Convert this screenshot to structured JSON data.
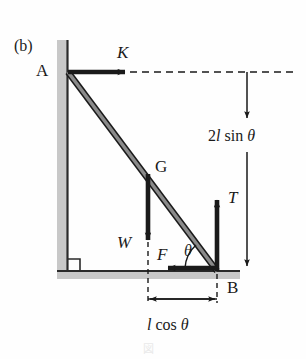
{
  "figure": {
    "panel_label": "(b)",
    "background_color": "#fefefe",
    "stroke_color": "#1a1a1a",
    "wall_color": "#c8c8c8",
    "rod_color": "#6e6e6e",
    "width": 306,
    "height": 359
  },
  "points": {
    "A": {
      "label": "A",
      "x": 68,
      "y": 72
    },
    "B": {
      "label": "B",
      "x": 217,
      "y": 271
    },
    "G": {
      "label": "G",
      "x": 148,
      "y": 172
    }
  },
  "forces": [
    {
      "name": "K",
      "label": "K",
      "direction": "right",
      "applied_at": "A"
    },
    {
      "name": "W",
      "label": "W",
      "direction": "down",
      "applied_at": "G"
    },
    {
      "name": "T",
      "label": "T",
      "direction": "up",
      "applied_at": "B"
    },
    {
      "name": "F",
      "label": "F",
      "direction": "left",
      "applied_at": "B"
    }
  ],
  "angle": {
    "label": "θ",
    "at": "B",
    "between": "rod and ground"
  },
  "dimensions": [
    {
      "name": "vertical-height",
      "label_plain": "2l sin θ",
      "label_number": "2",
      "label_italic_l": "l",
      "label_sin": " sin ",
      "label_theta": "θ",
      "orientation": "vertical",
      "from_y": 72,
      "to_y": 271,
      "at_x": 247
    },
    {
      "name": "horizontal-distance",
      "label_plain": "l cos θ",
      "label_italic_l": "l",
      "label_cos": " cos ",
      "label_theta": "θ",
      "orientation": "horizontal",
      "from_x": 148,
      "to_x": 217,
      "at_y": 299
    }
  ],
  "caption": {
    "text": "図"
  }
}
